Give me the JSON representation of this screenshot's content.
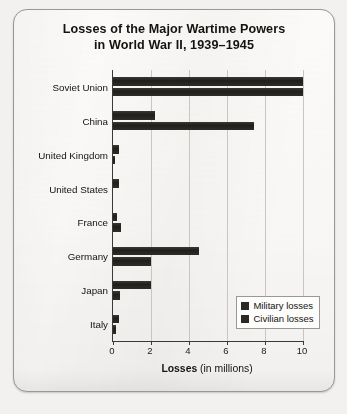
{
  "figure": {
    "title_line_1": "Losses of the Major Wartime Powers",
    "title_line_2": "in World War II, 1939–1945"
  },
  "chart_data": {
    "type": "bar",
    "orientation": "horizontal",
    "title": "Losses of the Major Wartime Powers in World War II, 1939–1945",
    "xlabel_strong": "Losses",
    "xlabel_rest": " (in millions)",
    "xlabel": "Losses (in millions)",
    "ylabel": "",
    "xlim": [
      0,
      10
    ],
    "xticks": [
      0,
      2,
      4,
      6,
      8,
      10
    ],
    "xtick_labels": [
      "0",
      "2",
      "4",
      "6",
      "8",
      "10"
    ],
    "grid": "vertical",
    "legend_position": "bottom-right",
    "bar_color": "#2b2926",
    "categories": [
      "Soviet Union",
      "China",
      "United Kingdom",
      "United States",
      "France",
      "Germany",
      "Japan",
      "Italy"
    ],
    "series": [
      {
        "name": "Military losses",
        "values": [
          10.0,
          2.2,
          0.33,
          0.3,
          0.21,
          4.5,
          2.0,
          0.33
        ]
      },
      {
        "name": "Civilian losses",
        "values": [
          10.0,
          7.4,
          0.07,
          0.0,
          0.4,
          2.0,
          0.36,
          0.15
        ]
      }
    ],
    "legend": [
      "Military losses",
      "Civilian losses"
    ]
  }
}
